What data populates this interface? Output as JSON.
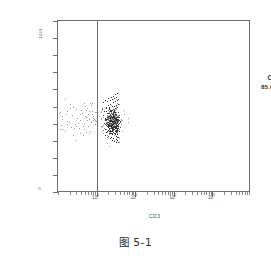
{
  "figure": {
    "caption": "图 5-1"
  },
  "chart_data": {
    "type": "scatter",
    "title": "",
    "subtitle": "",
    "xlabel": "CD3",
    "ylabel": "FS LIN",
    "xscale": "log",
    "yscale": "linear",
    "xlim": [
      1,
      10000
    ],
    "ylim": [
      0,
      1023
    ],
    "x_tick_labels": [
      "10",
      "10",
      "10",
      "10"
    ],
    "x_tick_exponents": [
      "0",
      "1",
      "2",
      "3"
    ],
    "x_tick_values": [
      1,
      10,
      100,
      1000
    ],
    "y_tick_labels": [
      "1023",
      "0"
    ],
    "y_tick_values": [
      1023,
      0
    ],
    "grid": false,
    "legend": "none",
    "gate": {
      "type": "vertical-threshold",
      "x_value": 1,
      "region_name": "C",
      "region_percent": "85.6%"
    },
    "annotations": [
      {
        "label": "C",
        "value": "85.6%",
        "x": 400,
        "y": 790
      }
    ],
    "series": [
      {
        "name": "CD3 positive cluster",
        "description": "dense cell population right of gate",
        "n_points": 430,
        "x_center": 2.6,
        "y_center": 430,
        "points": [
          [
            1.38,
            498
          ],
          [
            1.55,
            489
          ],
          [
            1.72,
            505
          ],
          [
            1.9,
            476
          ],
          [
            2.08,
            512
          ],
          [
            2.25,
            467
          ],
          [
            2.42,
            493
          ],
          [
            2.6,
            481
          ],
          [
            2.78,
            460
          ],
          [
            2.95,
            503
          ],
          [
            3.12,
            471
          ],
          [
            3.3,
            452
          ],
          [
            1.45,
            462
          ],
          [
            1.62,
            447
          ],
          [
            1.8,
            441
          ],
          [
            1.98,
            455
          ],
          [
            2.15,
            430
          ],
          [
            2.33,
            438
          ],
          [
            2.5,
            424
          ],
          [
            2.68,
            446
          ],
          [
            2.86,
            418
          ],
          [
            3.04,
            434
          ],
          [
            3.21,
            409
          ],
          [
            3.4,
            426
          ],
          [
            1.52,
            418
          ],
          [
            1.7,
            404
          ],
          [
            1.88,
            412
          ],
          [
            2.05,
            396
          ],
          [
            2.22,
            407
          ],
          [
            2.4,
            389
          ],
          [
            2.58,
            400
          ],
          [
            2.75,
            383
          ],
          [
            2.93,
            394
          ],
          [
            3.1,
            377
          ],
          [
            3.28,
            386
          ],
          [
            3.45,
            370
          ],
          [
            1.6,
            380
          ],
          [
            1.78,
            366
          ],
          [
            1.95,
            374
          ],
          [
            2.13,
            358
          ],
          [
            2.3,
            369
          ],
          [
            2.48,
            351
          ],
          [
            2.65,
            362
          ],
          [
            2.83,
            345
          ],
          [
            3.0,
            356
          ],
          [
            3.18,
            340
          ],
          [
            3.35,
            349
          ],
          [
            3.52,
            334
          ],
          [
            1.68,
            345
          ],
          [
            1.85,
            332
          ],
          [
            2.02,
            340
          ],
          [
            2.2,
            325
          ],
          [
            2.38,
            336
          ],
          [
            2.55,
            318
          ],
          [
            2.72,
            329
          ],
          [
            2.9,
            312
          ],
          [
            3.08,
            323
          ],
          [
            3.25,
            306
          ],
          [
            3.42,
            316
          ],
          [
            3.6,
            301
          ],
          [
            1.75,
            512
          ],
          [
            1.92,
            524
          ],
          [
            2.1,
            508
          ],
          [
            2.28,
            531
          ],
          [
            2.45,
            516
          ],
          [
            2.63,
            540
          ],
          [
            2.8,
            520
          ],
          [
            2.98,
            546
          ],
          [
            3.15,
            525
          ],
          [
            3.33,
            552
          ],
          [
            3.5,
            528
          ],
          [
            3.68,
            558
          ],
          [
            1.48,
            540
          ],
          [
            1.65,
            556
          ],
          [
            1.83,
            548
          ],
          [
            2.0,
            564
          ],
          [
            2.18,
            552
          ],
          [
            2.35,
            572
          ],
          [
            2.53,
            560
          ],
          [
            2.7,
            580
          ],
          [
            2.88,
            566
          ],
          [
            3.05,
            588
          ],
          [
            3.23,
            572
          ],
          [
            3.4,
            594
          ]
        ]
      },
      {
        "name": "CD3 negative scattered events",
        "description": "sparse events left of gate",
        "n_points": 38,
        "points": [
          [
            0.1,
            455
          ],
          [
            0.13,
            438
          ],
          [
            0.16,
            470
          ],
          [
            0.19,
            425
          ],
          [
            0.23,
            462
          ],
          [
            0.27,
            410
          ],
          [
            0.31,
            448
          ],
          [
            0.36,
            432
          ],
          [
            0.41,
            478
          ],
          [
            0.46,
            418
          ],
          [
            0.52,
            452
          ],
          [
            0.58,
            396
          ],
          [
            0.64,
            440
          ],
          [
            0.71,
            424
          ],
          [
            0.12,
            402
          ],
          [
            0.17,
            486
          ],
          [
            0.22,
            390
          ],
          [
            0.29,
            500
          ],
          [
            0.34,
            384
          ],
          [
            0.4,
            494
          ],
          [
            0.48,
            378
          ],
          [
            0.56,
            506
          ],
          [
            0.66,
            372
          ],
          [
            0.76,
            488
          ],
          [
            0.09,
            418
          ],
          [
            0.15,
            368
          ],
          [
            0.25,
            512
          ],
          [
            0.38,
            360
          ],
          [
            0.5,
            520
          ],
          [
            0.62,
            356
          ],
          [
            0.74,
            468
          ],
          [
            0.83,
            440
          ],
          [
            0.88,
            410
          ],
          [
            0.92,
            480
          ],
          [
            0.95,
            430
          ],
          [
            0.2,
            530
          ],
          [
            0.44,
            348
          ],
          [
            0.68,
            538
          ]
        ]
      }
    ]
  }
}
